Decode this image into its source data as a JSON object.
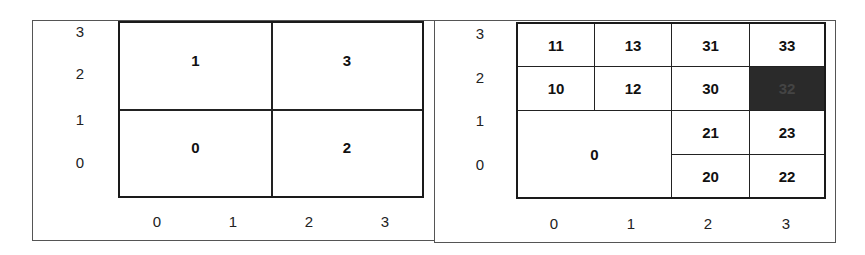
{
  "left_panel": {
    "y_ticks": [
      "3",
      "2",
      "1",
      "0"
    ],
    "x_ticks": [
      "0",
      "1",
      "2",
      "3"
    ],
    "cells": [
      {
        "label": "1",
        "x": [
          0,
          2
        ],
        "y": [
          2,
          4
        ]
      },
      {
        "label": "3",
        "x": [
          2,
          4
        ],
        "y": [
          2,
          4
        ]
      },
      {
        "label": "0",
        "x": [
          0,
          2
        ],
        "y": [
          0,
          2
        ]
      },
      {
        "label": "2",
        "x": [
          2,
          4
        ],
        "y": [
          0,
          2
        ]
      }
    ]
  },
  "right_panel": {
    "y_ticks": [
      "3",
      "2",
      "1",
      "0"
    ],
    "x_ticks": [
      "0",
      "1",
      "2",
      "3"
    ],
    "cells": [
      {
        "label": "11",
        "x": [
          0,
          1
        ],
        "y": [
          3,
          4
        ]
      },
      {
        "label": "13",
        "x": [
          1,
          2
        ],
        "y": [
          3,
          4
        ]
      },
      {
        "label": "31",
        "x": [
          2,
          3
        ],
        "y": [
          3,
          4
        ]
      },
      {
        "label": "33",
        "x": [
          3,
          4
        ],
        "y": [
          3,
          4
        ]
      },
      {
        "label": "10",
        "x": [
          0,
          1
        ],
        "y": [
          2,
          3
        ]
      },
      {
        "label": "12",
        "x": [
          1,
          2
        ],
        "y": [
          2,
          3
        ]
      },
      {
        "label": "30",
        "x": [
          2,
          3
        ],
        "y": [
          2,
          3
        ]
      },
      {
        "label": "32",
        "x": [
          3,
          4
        ],
        "y": [
          2,
          3
        ],
        "highlighted": true
      },
      {
        "label": "0",
        "x": [
          0,
          2
        ],
        "y": [
          0,
          2
        ]
      },
      {
        "label": "21",
        "x": [
          2,
          3
        ],
        "y": [
          1,
          2
        ]
      },
      {
        "label": "23",
        "x": [
          3,
          4
        ],
        "y": [
          1,
          2
        ]
      },
      {
        "label": "20",
        "x": [
          2,
          3
        ],
        "y": [
          0,
          1
        ]
      },
      {
        "label": "22",
        "x": [
          3,
          4
        ],
        "y": [
          0,
          1
        ]
      }
    ],
    "highlight_color": "#2a2a2a"
  }
}
